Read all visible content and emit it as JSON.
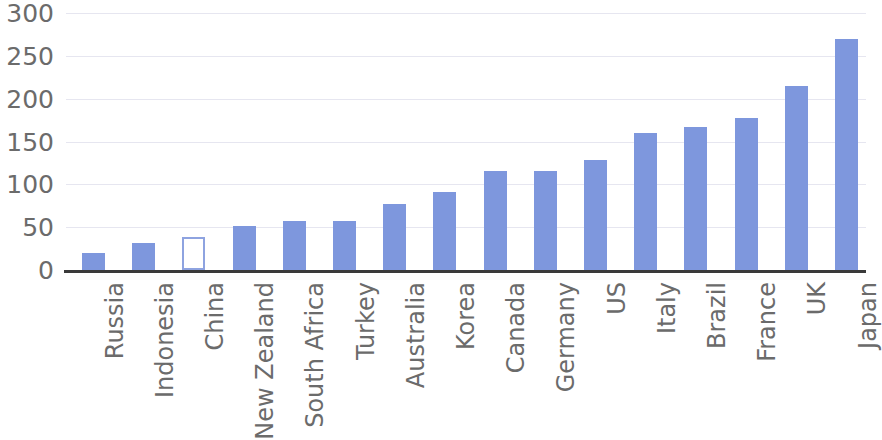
{
  "chart_data": {
    "type": "bar",
    "title": "",
    "subtitle": "",
    "xlabel": "",
    "ylabel": "",
    "ylim": [
      0,
      300
    ],
    "yticks": [
      0,
      50,
      100,
      150,
      200,
      250,
      300
    ],
    "ytick_labels": [
      "0",
      "50",
      "100",
      "150",
      "200",
      "250",
      "300"
    ],
    "grid": true,
    "legend": "none",
    "orientation": "vertical",
    "bar_color": "#7e97dd",
    "highlight_color": "#8ea3e0",
    "highlight_style": "hollow-outline",
    "highlight_category": "China",
    "categories": [
      "Russia",
      "Indonesia",
      "China",
      "New Zealand",
      "South Africa",
      "Turkey",
      "Australia",
      "Korea",
      "Canada",
      "Germany",
      "US",
      "Italy",
      "Brazil",
      "France",
      "UK",
      "Japan"
    ],
    "values": [
      20,
      32,
      38,
      51,
      57,
      57,
      77,
      91,
      116,
      116,
      128,
      160,
      167,
      178,
      215,
      270
    ],
    "bars": [
      {
        "label": "Russia",
        "value": 20,
        "style": "filled"
      },
      {
        "label": "Indonesia",
        "value": 32,
        "style": "filled"
      },
      {
        "label": "China",
        "value": 38,
        "style": "hollow"
      },
      {
        "label": "New Zealand",
        "value": 51,
        "style": "filled"
      },
      {
        "label": "South Africa",
        "value": 57,
        "style": "filled"
      },
      {
        "label": "Turkey",
        "value": 57,
        "style": "filled"
      },
      {
        "label": "Australia",
        "value": 77,
        "style": "filled"
      },
      {
        "label": "Korea",
        "value": 91,
        "style": "filled"
      },
      {
        "label": "Canada",
        "value": 116,
        "style": "filled"
      },
      {
        "label": "Germany",
        "value": 116,
        "style": "filled"
      },
      {
        "label": "US",
        "value": 128,
        "style": "filled"
      },
      {
        "label": "Italy",
        "value": 160,
        "style": "filled"
      },
      {
        "label": "Brazil",
        "value": 167,
        "style": "filled"
      },
      {
        "label": "France",
        "value": 178,
        "style": "filled"
      },
      {
        "label": "UK",
        "value": 215,
        "style": "filled"
      },
      {
        "label": "Japan",
        "value": 270,
        "style": "filled"
      }
    ]
  }
}
